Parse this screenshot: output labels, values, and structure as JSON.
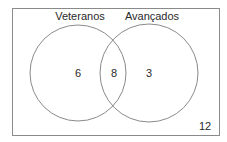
{
  "diagram": {
    "type": "venn",
    "universe_count": "12",
    "sets": [
      {
        "label": "Veteranos",
        "only_count": "6"
      },
      {
        "label": "Avançados",
        "only_count": "3"
      }
    ],
    "intersection_count": "8",
    "colors": {
      "stroke": "#8a8a8a",
      "text": "#2a2a2a",
      "background": "#ffffff"
    }
  }
}
